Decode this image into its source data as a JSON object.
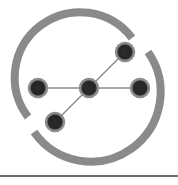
{
  "logo": {
    "name": "network-graph-logo",
    "ring": {
      "cx": 89,
      "cy": 90,
      "r": 63,
      "stroke_width": 8,
      "color": "#8a8a8a"
    },
    "nodes": [
      {
        "id": "center",
        "x": 89,
        "y": 88
      },
      {
        "id": "top-right",
        "x": 125,
        "y": 52
      },
      {
        "id": "right",
        "x": 140,
        "y": 88
      },
      {
        "id": "left",
        "x": 38,
        "y": 88
      },
      {
        "id": "bottom-left",
        "x": 55,
        "y": 122
      }
    ],
    "node_color": "#2a2a2a",
    "node_halo_color": "#8c8c8c",
    "edge_color": "#8a8a8a"
  },
  "divider": {
    "color": "#6e6e6e"
  }
}
